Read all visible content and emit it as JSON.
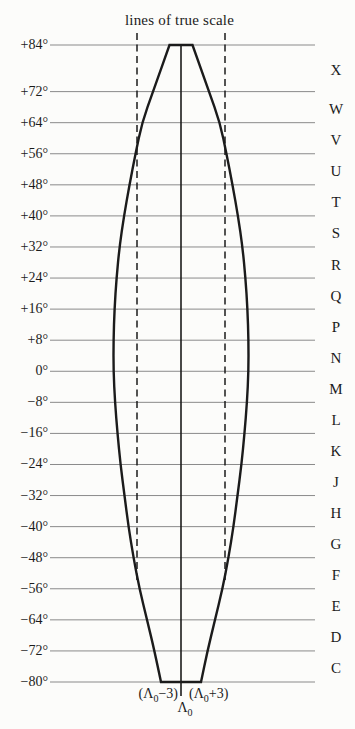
{
  "title": "lines of true scale",
  "latitudes": [
    "+84°",
    "+72°",
    "+64°",
    "+56°",
    "+48°",
    "+40°",
    "+32°",
    "+24°",
    "+16°",
    "+8°",
    "0°",
    "−8°",
    "−16°",
    "−24°",
    "−32°",
    "−40°",
    "−48°",
    "−56°",
    "−64°",
    "−72°",
    "−80°"
  ],
  "band_letters": [
    "X",
    "W",
    "V",
    "U",
    "T",
    "S",
    "R",
    "Q",
    "P",
    "N",
    "M",
    "L",
    "K",
    "J",
    "H",
    "G",
    "F",
    "E",
    "D",
    "C"
  ],
  "west_boundary": {
    "pre": "(Λ",
    "sub": "0",
    "post": "−3)"
  },
  "east_boundary": {
    "pre": "(Λ",
    "sub": "0",
    "post": "+3)"
  },
  "central_meridian": {
    "pre": "Λ",
    "sub": "0"
  },
  "colors": {
    "ink": "#1b1b1b",
    "grid": "#8a8a8a",
    "background": "#fcfcfa"
  }
}
